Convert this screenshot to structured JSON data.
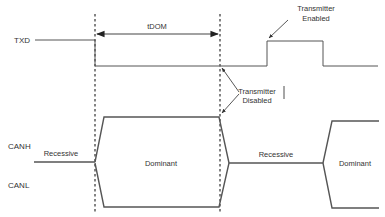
{
  "diagram": {
    "type": "timing-diagram",
    "signals": {
      "txd": "TXD",
      "canh": "CANH",
      "canl": "CANL"
    },
    "timing": {
      "tdom": "tDOM"
    },
    "annotations": {
      "enabled_line1": "Transmitter",
      "enabled_line2": "Enabled",
      "disabled_line1": "Transmitter",
      "disabled_line2": "Disabled"
    },
    "bus_states": {
      "recessive_1": "Recessive",
      "dominant_1": "Dominant",
      "recessive_2": "Recessive",
      "dominant_2": "Dominant"
    },
    "colors": {
      "line": "#555555",
      "text": "#333333",
      "background": "#ffffff"
    }
  }
}
